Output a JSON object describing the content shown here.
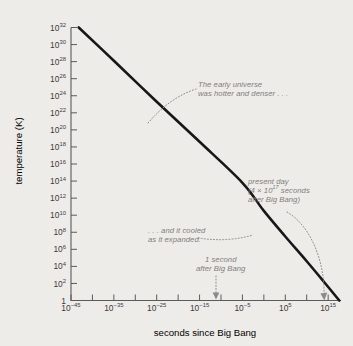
{
  "chart_data": {
    "type": "line",
    "title": "",
    "xlabel": "seconds since Big Bang",
    "ylabel": "temperature (K)",
    "x_scale": "log",
    "y_scale": "log",
    "xlim": [
      1e-45,
      1e+18
    ],
    "ylim": [
      1,
      1e+32
    ],
    "grid": false,
    "legend": null,
    "x_tick_labels": [
      {
        "mantissa": "10",
        "exponent": "−45"
      },
      {
        "mantissa": "10",
        "exponent": "−35"
      },
      {
        "mantissa": "10",
        "exponent": "−25"
      },
      {
        "mantissa": "10",
        "exponent": "−15"
      },
      {
        "mantissa": "10",
        "exponent": "−5"
      },
      {
        "mantissa": "10",
        "exponent": "5"
      },
      {
        "mantissa": "10",
        "exponent": "15"
      }
    ],
    "x_tick_exponents": [
      -45,
      -35,
      -25,
      -15,
      -5,
      5,
      15
    ],
    "x_minor_tick_exponents": [
      -40,
      -30,
      -20,
      -10,
      0,
      10
    ],
    "y_tick_labels": [
      {
        "mantissa": "10",
        "exponent": "32"
      },
      {
        "mantissa": "10",
        "exponent": "30"
      },
      {
        "mantissa": "10",
        "exponent": "28"
      },
      {
        "mantissa": "10",
        "exponent": "26"
      },
      {
        "mantissa": "10",
        "exponent": "24"
      },
      {
        "mantissa": "10",
        "exponent": "22"
      },
      {
        "mantissa": "10",
        "exponent": "20"
      },
      {
        "mantissa": "10",
        "exponent": "18"
      },
      {
        "mantissa": "10",
        "exponent": "16"
      },
      {
        "mantissa": "10",
        "exponent": "14"
      },
      {
        "mantissa": "10",
        "exponent": "12"
      },
      {
        "mantissa": "10",
        "exponent": "10"
      },
      {
        "mantissa": "10",
        "exponent": "8"
      },
      {
        "mantissa": "10",
        "exponent": "6"
      },
      {
        "mantissa": "10",
        "exponent": "4"
      },
      {
        "mantissa": "10",
        "exponent": "2"
      },
      {
        "mantissa": "1",
        "exponent": ""
      }
    ],
    "y_tick_exponents": [
      32,
      30,
      28,
      26,
      24,
      22,
      20,
      18,
      16,
      14,
      12,
      10,
      8,
      6,
      4,
      2,
      0
    ],
    "series": [
      {
        "name": "temperature of the universe",
        "color": "#17171a",
        "points": [
          {
            "x_exp": -43.2,
            "y_exp": 32.0
          },
          {
            "x_exp": -35.0,
            "y_exp": 28.1
          },
          {
            "x_exp": -25.0,
            "y_exp": 23.3
          },
          {
            "x_exp": -15.0,
            "y_exp": 18.6
          },
          {
            "x_exp": -5.0,
            "y_exp": 13.8
          },
          {
            "x_exp": 0.0,
            "y_exp": 10.5
          },
          {
            "x_exp": 5.0,
            "y_exp": 7.5
          },
          {
            "x_exp": 10.0,
            "y_exp": 4.6
          },
          {
            "x_exp": 14.0,
            "y_exp": 2.2
          },
          {
            "x_exp": 17.6,
            "y_exp": 0.0
          }
        ]
      }
    ],
    "annotations": [
      {
        "id": "early-universe",
        "lines": [
          "The early universe",
          "was hotter and denser . . ."
        ],
        "color": "#807e7b",
        "style": "italic",
        "points_to": {
          "x_exp": -27.0,
          "y_exp": 22.3
        }
      },
      {
        "id": "cooled-expanded",
        "lines": [
          ". . . and it cooled",
          "as it expanded."
        ],
        "color": "#807e7b",
        "style": "italic",
        "points_to": {
          "x_exp": 6.2,
          "y_exp": 6.9
        }
      },
      {
        "id": "one-second",
        "lines": [
          "1 second",
          "after Big Bang"
        ],
        "color": "#807e7b",
        "style": "italic",
        "points_to": {
          "x_exp": 0.0,
          "y_exp": 0.0
        }
      },
      {
        "id": "present-day",
        "lines": [
          "present day",
          "(4 × 10^17 seconds",
          "after Big Bang)"
        ],
        "value_label": "4 × 10¹⁷ seconds",
        "color": "#807e7b",
        "style": "italic",
        "points_to": {
          "x_exp": 17.6,
          "y_exp": 0.0
        }
      }
    ]
  },
  "figure": {
    "background_color": "#eeece8",
    "axis_color": "#5a5a5a",
    "curve_color": "#17171a",
    "annotation_color": "#807e7b"
  },
  "axes": {
    "x_title": "seconds since Big Bang",
    "y_title": "temperature (K)"
  },
  "annotations": {
    "early": {
      "line1": "The early universe",
      "line2": "was hotter and denser . . ."
    },
    "cooled": {
      "line1": ". . . and it cooled",
      "line2": "as it expanded."
    },
    "one_second": {
      "line1": "1 second",
      "line2": "after Big Bang"
    },
    "present": {
      "line1": "present day",
      "line2_pre": "(4 × 10",
      "line2_sup": "17",
      "line2_post": " seconds",
      "line3": "after Big Bang)"
    }
  }
}
